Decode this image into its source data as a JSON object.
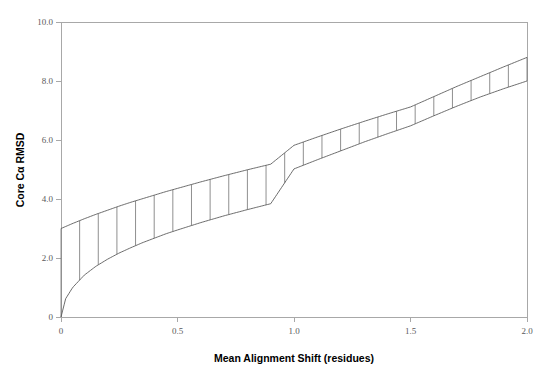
{
  "chart_data": {
    "type": "area",
    "title": "",
    "subtitle": "",
    "xlabel": "Mean Alignment Shift (residues)",
    "ylabel": "Core Cα RMSD",
    "xlim": [
      0,
      2.0
    ],
    "ylim": [
      0,
      10.0
    ],
    "xticks": [
      0,
      0.5,
      1.0,
      1.5,
      2.0
    ],
    "xtick_labels": [
      "0",
      "0.5",
      "1.0",
      "1.5",
      "2.0"
    ],
    "yticks": [
      0,
      2.0,
      4.0,
      6.0,
      8.0,
      10.0
    ],
    "ytick_labels": [
      "0",
      "2.0",
      "4.0",
      "6.0",
      "8.0",
      "10.0"
    ],
    "grid": false,
    "legend": null,
    "legend_position": "none",
    "fill_style": "hatched-rungs",
    "hatch_count": 25,
    "series": [
      {
        "name": "Upper bound",
        "x": [
          0.0,
          0.05,
          0.1,
          0.15,
          0.2,
          0.25,
          0.3,
          0.35,
          0.4,
          0.45,
          0.5,
          0.6,
          0.7,
          0.8,
          0.9,
          1.0,
          1.1,
          1.2,
          1.3,
          1.4,
          1.5,
          1.6,
          1.7,
          1.8,
          1.9,
          2.0
        ],
        "values": [
          3.0,
          3.17,
          3.33,
          3.48,
          3.62,
          3.76,
          3.89,
          4.01,
          4.13,
          4.25,
          4.36,
          4.58,
          4.79,
          4.99,
          5.18,
          5.82,
          6.1,
          6.37,
          6.63,
          6.88,
          7.12,
          7.47,
          7.82,
          8.15,
          8.48,
          8.8
        ]
      },
      {
        "name": "Lower bound",
        "x": [
          0.0,
          0.02,
          0.05,
          0.1,
          0.15,
          0.2,
          0.25,
          0.3,
          0.35,
          0.4,
          0.45,
          0.5,
          0.6,
          0.7,
          0.8,
          0.9,
          1.0,
          1.1,
          1.2,
          1.3,
          1.4,
          1.5,
          1.6,
          1.7,
          1.8,
          1.9,
          2.0
        ],
        "values": [
          0.0,
          0.62,
          1.0,
          1.42,
          1.72,
          1.96,
          2.17,
          2.35,
          2.52,
          2.67,
          2.82,
          2.95,
          3.2,
          3.43,
          3.64,
          3.84,
          5.02,
          5.33,
          5.63,
          5.93,
          6.21,
          6.48,
          6.82,
          7.15,
          7.46,
          7.74,
          8.0
        ]
      }
    ],
    "annotations": []
  },
  "axes": {
    "y_title": "Core Cα RMSD",
    "x_title": "Mean Alignment Shift (residues)"
  }
}
